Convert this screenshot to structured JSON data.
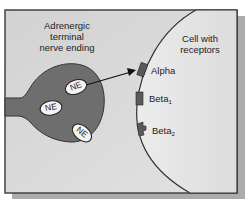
{
  "diagram": {
    "nerve_label": [
      "Adrenergic",
      "terminal",
      "nerve ending"
    ],
    "cell_label": [
      "Cell with",
      "receptors"
    ],
    "vesicles": [
      "NE",
      "NE",
      "NE"
    ],
    "receptors": [
      {
        "name": "Alpha",
        "sub": ""
      },
      {
        "name": "Beta",
        "sub": "1"
      },
      {
        "name": "Beta",
        "sub": "2"
      }
    ],
    "colors": {
      "background": "#d6d6d6",
      "nerve": "#6e6e6e",
      "cell": "#e6e6e6",
      "receptor": "#555555",
      "shadow": "#a8a8a8"
    }
  }
}
